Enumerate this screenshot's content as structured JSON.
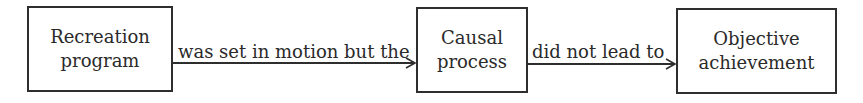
{
  "diagram": {
    "nodes": [
      {
        "id": "recreation-program",
        "lines": [
          "Recreation",
          "program"
        ]
      },
      {
        "id": "causal-process",
        "lines": [
          "Causal",
          "process"
        ]
      },
      {
        "id": "objective-achievement",
        "lines": [
          "Objective",
          "achievement"
        ]
      }
    ],
    "edges": [
      {
        "from": "recreation-program",
        "to": "causal-process",
        "label": "was set in motion but the"
      },
      {
        "from": "causal-process",
        "to": "objective-achievement",
        "label": "did not lead to"
      }
    ]
  }
}
